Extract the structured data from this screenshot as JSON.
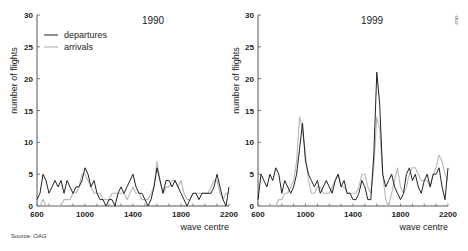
{
  "source": "Source: OAG",
  "figure_code": "6819",
  "legend": {
    "departures": "departures",
    "arrivals": "arrivals"
  },
  "colors": {
    "departures": "#222222",
    "arrivals": "#b8b8b8",
    "axis": "#555555"
  },
  "chart_data": [
    {
      "type": "line",
      "title": "1990",
      "xlabel": "wave centre",
      "ylabel": "number of flights",
      "xlim": [
        600,
        2200
      ],
      "ylim": [
        0,
        30
      ],
      "xticks": [
        600,
        1000,
        1400,
        1800,
        2200
      ],
      "yticks": [
        0,
        5,
        10,
        15,
        20,
        25,
        30
      ],
      "grid": false,
      "legend_position": "upper left",
      "x": [
        600,
        625,
        650,
        675,
        700,
        725,
        750,
        775,
        800,
        825,
        850,
        875,
        900,
        925,
        950,
        975,
        1000,
        1025,
        1050,
        1075,
        1100,
        1125,
        1150,
        1175,
        1200,
        1225,
        1250,
        1275,
        1300,
        1325,
        1350,
        1375,
        1400,
        1425,
        1450,
        1475,
        1500,
        1525,
        1550,
        1575,
        1600,
        1625,
        1650,
        1675,
        1700,
        1725,
        1750,
        1775,
        1800,
        1825,
        1850,
        1875,
        1900,
        1925,
        1950,
        1975,
        2000,
        2025,
        2050,
        2075,
        2100,
        2125,
        2150,
        2175,
        2200
      ],
      "series": [
        {
          "name": "departures",
          "values": [
            1,
            2,
            5,
            4,
            2,
            3,
            4,
            3,
            4,
            2,
            4,
            3,
            2,
            3,
            3,
            4,
            6,
            5,
            3,
            4,
            2,
            1,
            1,
            0,
            1,
            1,
            0,
            2,
            3,
            2,
            3,
            4,
            5,
            3,
            2,
            2,
            1,
            0,
            1,
            3,
            6,
            4,
            2,
            4,
            4,
            3,
            4,
            3,
            2,
            1,
            0,
            1,
            2,
            2,
            1,
            2,
            2,
            2,
            2,
            3,
            5,
            3,
            1,
            0,
            3
          ]
        },
        {
          "name": "arrivals",
          "values": [
            0,
            0,
            1,
            0,
            0,
            0,
            0,
            0,
            0,
            1,
            1,
            1,
            2,
            2,
            3,
            5,
            5,
            4,
            3,
            2,
            2,
            2,
            1,
            1,
            1,
            2,
            2,
            2,
            2,
            2,
            1,
            2,
            3,
            2,
            2,
            1,
            1,
            1,
            2,
            3,
            7,
            4,
            2,
            3,
            3,
            4,
            4,
            3,
            4,
            2,
            1,
            1,
            2,
            2,
            2,
            2,
            2,
            2,
            3,
            4,
            4,
            2,
            1,
            2,
            2
          ]
        }
      ]
    },
    {
      "type": "line",
      "title": "1999",
      "xlabel": "wave centre",
      "ylabel": "number of flights",
      "xlim": [
        600,
        2200
      ],
      "ylim": [
        0,
        30
      ],
      "xticks": [
        600,
        1000,
        1400,
        1800,
        2200
      ],
      "yticks": [
        0,
        5,
        10,
        15,
        20,
        25,
        30
      ],
      "grid": false,
      "x": [
        600,
        625,
        650,
        675,
        700,
        725,
        750,
        775,
        800,
        825,
        850,
        875,
        900,
        925,
        950,
        975,
        1000,
        1025,
        1050,
        1075,
        1100,
        1125,
        1150,
        1175,
        1200,
        1225,
        1250,
        1275,
        1300,
        1325,
        1350,
        1375,
        1400,
        1425,
        1450,
        1475,
        1500,
        1525,
        1550,
        1575,
        1600,
        1625,
        1650,
        1675,
        1700,
        1725,
        1750,
        1775,
        1800,
        1825,
        1850,
        1875,
        1900,
        1925,
        1950,
        1975,
        2000,
        2025,
        2050,
        2075,
        2100,
        2125,
        2150,
        2175,
        2200
      ],
      "series": [
        {
          "name": "departures",
          "values": [
            1,
            5,
            4,
            3,
            5,
            4,
            6,
            5,
            2,
            4,
            3,
            2,
            3,
            5,
            9,
            13,
            7,
            5,
            4,
            3,
            4,
            2,
            3,
            4,
            3,
            2,
            4,
            5,
            3,
            4,
            2,
            2,
            1,
            1,
            2,
            4,
            3,
            1,
            1,
            8,
            21,
            16,
            5,
            3,
            4,
            5,
            3,
            2,
            1,
            2,
            5,
            6,
            4,
            5,
            3,
            2,
            4,
            5,
            3,
            5,
            5,
            6,
            3,
            1,
            6
          ]
        },
        {
          "name": "arrivals",
          "values": [
            0,
            0,
            0,
            0,
            0,
            0,
            0,
            1,
            1,
            2,
            2,
            3,
            4,
            7,
            14,
            12,
            8,
            4,
            2,
            2,
            3,
            3,
            2,
            2,
            2,
            3,
            4,
            5,
            3,
            3,
            2,
            2,
            2,
            2,
            3,
            5,
            5,
            3,
            2,
            6,
            14,
            12,
            5,
            1,
            0,
            2,
            4,
            6,
            3,
            2,
            3,
            5,
            6,
            6,
            5,
            4,
            4,
            4,
            3,
            5,
            6,
            8,
            7,
            5,
            4
          ]
        }
      ]
    }
  ]
}
